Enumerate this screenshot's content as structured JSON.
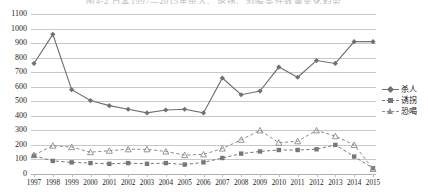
{
  "chart_data": {
    "type": "line",
    "title": "图4-2 日本1997—2015年杀人、诱拐、恐喝案件数量变化趋势",
    "xlabel": "",
    "ylabel": "",
    "ylim": [
      0,
      1100
    ],
    "ytick_step": 100,
    "grid": true,
    "legend_position": "right",
    "categories": [
      "1997",
      "1998",
      "1999",
      "2000",
      "2001",
      "2002",
      "2003",
      "2004",
      "2005",
      "2006",
      "2007",
      "2008",
      "2009",
      "2010",
      "2011",
      "2012",
      "2013",
      "2014",
      "2015"
    ],
    "series": [
      {
        "name": "杀人",
        "marker": "diamond",
        "linestyle": "solid",
        "color": "#6f6f77",
        "values": [
          760,
          960,
          580,
          505,
          470,
          445,
          420,
          440,
          445,
          420,
          660,
          545,
          570,
          735,
          665,
          780,
          760,
          910,
          910
        ]
      },
      {
        "name": "诱拐",
        "marker": "square",
        "linestyle": "dashed",
        "color": "#76767e",
        "values": [
          125,
          90,
          80,
          75,
          70,
          75,
          70,
          75,
          65,
          80,
          110,
          140,
          155,
          165,
          165,
          170,
          200,
          120,
          40
        ]
      },
      {
        "name": "恐喝",
        "marker": "triangle",
        "linestyle": "dashed",
        "color": "#8b8b93",
        "values": [
          130,
          195,
          185,
          150,
          160,
          170,
          170,
          155,
          130,
          135,
          175,
          235,
          300,
          215,
          225,
          300,
          260,
          200,
          35
        ]
      }
    ],
    "ytick_labels": [
      "0",
      "100",
      "200",
      "300",
      "400",
      "500",
      "600",
      "700",
      "800",
      "900",
      "1000",
      "1100"
    ]
  }
}
